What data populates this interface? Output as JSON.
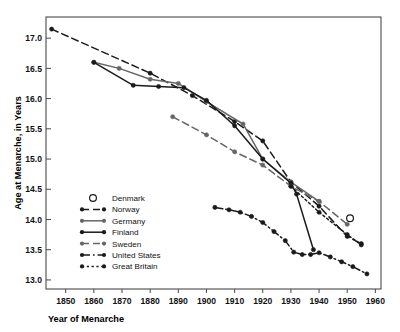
{
  "chart_data": {
    "type": "line",
    "title": "",
    "xlabel": "Year of Menarche",
    "ylabel": "Age at Menarche, in Years",
    "xlim": [
      1843,
      1962
    ],
    "ylim": [
      12.85,
      17.35
    ],
    "grid": false,
    "legend_position": "inside-lower-left",
    "xticks": [
      1850,
      1860,
      1870,
      1880,
      1890,
      1900,
      1910,
      1920,
      1930,
      1940,
      1950,
      1960
    ],
    "xticklabels": [
      "1850",
      "1860",
      "1870",
      "1880",
      "1890",
      "1900",
      "1910",
      "1920",
      "1930",
      "1940",
      "1950",
      "1960"
    ],
    "yticks": [
      13.0,
      13.5,
      14.0,
      14.5,
      15.0,
      15.5,
      16.0,
      16.5,
      17.0
    ],
    "yticklabels": [
      "13.0",
      "13.5",
      "14.0",
      "14.5",
      "15.0",
      "15.5",
      "16.0",
      "16.5",
      "17.0"
    ],
    "series": [
      {
        "name": "Denmark",
        "style": "marker-only",
        "marker": "open-circle",
        "color": "#1a1a1a",
        "points": [
          [
            1951,
            14.02
          ]
        ]
      },
      {
        "name": "Norway",
        "style": "dashed",
        "marker": "filled-circle",
        "color": "#1a1a1a",
        "points": [
          [
            1845,
            17.15
          ],
          [
            1880,
            16.42
          ],
          [
            1895,
            16.05
          ],
          [
            1910,
            15.62
          ],
          [
            1920,
            15.3
          ],
          [
            1930,
            14.62
          ],
          [
            1940,
            14.22
          ],
          [
            1950,
            13.72
          ],
          [
            1955,
            13.6
          ]
        ]
      },
      {
        "name": "Germany",
        "style": "solid",
        "marker": "filled-circle",
        "color": "#666666",
        "points": [
          [
            1860,
            16.6
          ],
          [
            1869,
            16.5
          ],
          [
            1880,
            16.32
          ],
          [
            1890,
            16.25
          ],
          [
            1900,
            15.95
          ],
          [
            1913,
            15.58
          ],
          [
            1920,
            15.0
          ],
          [
            1930,
            14.62
          ],
          [
            1940,
            14.3
          ]
        ]
      },
      {
        "name": "Finland",
        "style": "solid",
        "marker": "filled-circle",
        "color": "#1a1a1a",
        "points": [
          [
            1860,
            16.6
          ],
          [
            1874,
            16.22
          ],
          [
            1883,
            16.2
          ],
          [
            1892,
            16.18
          ],
          [
            1900,
            15.97
          ],
          [
            1910,
            15.55
          ],
          [
            1920,
            15.0
          ],
          [
            1930,
            14.6
          ],
          [
            1932,
            14.42
          ],
          [
            1938,
            13.5
          ]
        ]
      },
      {
        "name": "Sweden",
        "style": "dashed",
        "marker": "filled-circle",
        "color": "#666666",
        "points": [
          [
            1888,
            15.7
          ],
          [
            1900,
            15.4
          ],
          [
            1910,
            15.12
          ],
          [
            1920,
            14.9
          ],
          [
            1930,
            14.55
          ],
          [
            1940,
            14.3
          ],
          [
            1950,
            13.92
          ]
        ]
      },
      {
        "name": "United States",
        "style": "dash-dot",
        "marker": "filled-circle",
        "color": "#1a1a1a",
        "points": [
          [
            1903,
            14.2
          ],
          [
            1908,
            14.16
          ],
          [
            1912,
            14.12
          ],
          [
            1916,
            14.05
          ],
          [
            1920,
            13.95
          ],
          [
            1924,
            13.8
          ],
          [
            1928,
            13.65
          ],
          [
            1931,
            13.46
          ],
          [
            1934,
            13.42
          ],
          [
            1937,
            13.42
          ],
          [
            1940,
            13.45
          ],
          [
            1944,
            13.38
          ],
          [
            1948,
            13.3
          ],
          [
            1952,
            13.22
          ],
          [
            1957,
            13.1
          ]
        ]
      },
      {
        "name": "Great Britain",
        "style": "dotted",
        "marker": "filled-circle",
        "color": "#1a1a1a",
        "points": [
          [
            1930,
            14.55
          ],
          [
            1940,
            14.12
          ],
          [
            1950,
            13.75
          ],
          [
            1955,
            13.58
          ]
        ]
      }
    ]
  },
  "legend": {
    "entries": [
      {
        "label": "Denmark"
      },
      {
        "label": "Norway"
      },
      {
        "label": "Germany"
      },
      {
        "label": "Finland"
      },
      {
        "label": "Sweden"
      },
      {
        "label": "United States"
      },
      {
        "label": "Great Britain"
      }
    ]
  }
}
